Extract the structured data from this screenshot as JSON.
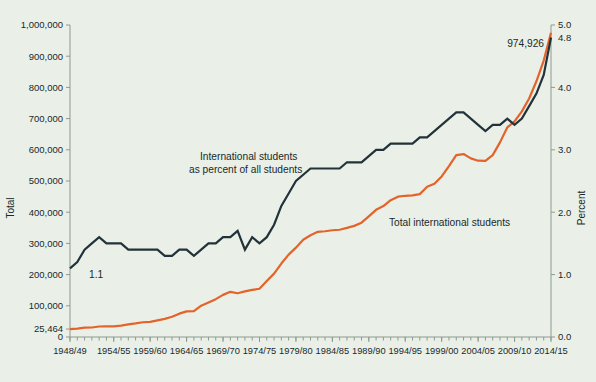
{
  "chart_data": {
    "type": "line",
    "title": "",
    "xlabel": "",
    "ylabel": "Total",
    "y2label": "Percent",
    "grid": false,
    "legend_position": "inline-annotations",
    "x_tick_labels": [
      "1948/49",
      "1954/55",
      "1959/60",
      "1964/65",
      "1969/70",
      "1974/75",
      "1979/80",
      "1984/85",
      "1989/90",
      "1994/95",
      "1999/00",
      "2004/05",
      "2009/10",
      "2014/15"
    ],
    "x_tick_years": [
      1948,
      1954,
      1959,
      1964,
      1969,
      1974,
      1979,
      1984,
      1989,
      1994,
      1999,
      2004,
      2009,
      2014
    ],
    "x_minor_tick_interval_years": 1,
    "xlim": [
      1948,
      2014
    ],
    "ylim": [
      0,
      1000000
    ],
    "y_tick_labels": [
      "0",
      "25,464",
      "100,000",
      "200,000",
      "300,000",
      "400,000",
      "500,000",
      "600,000",
      "700,000",
      "800,000",
      "900,000",
      "1,000,000"
    ],
    "y_tick_values": [
      0,
      25464,
      100000,
      200000,
      300000,
      400000,
      500000,
      600000,
      700000,
      800000,
      900000,
      1000000
    ],
    "y2lim": [
      0,
      5.0
    ],
    "y2_tick_labels": [
      "0.0",
      "1.0",
      "2.0",
      "3.0",
      "4.0",
      "5.0"
    ],
    "y2_tick_values": [
      0.0,
      1.0,
      2.0,
      3.0,
      4.0,
      5.0
    ],
    "series": [
      {
        "name": "Total international students",
        "axis": "left",
        "color": "#e4632a",
        "annotation": "Total international students",
        "start_label": "25,464",
        "end_label": "974,926",
        "x": [
          1948,
          1949,
          1950,
          1951,
          1952,
          1953,
          1954,
          1955,
          1956,
          1957,
          1958,
          1959,
          1960,
          1961,
          1962,
          1963,
          1964,
          1965,
          1966,
          1967,
          1968,
          1969,
          1970,
          1971,
          1972,
          1973,
          1974,
          1975,
          1976,
          1977,
          1978,
          1979,
          1980,
          1981,
          1982,
          1983,
          1984,
          1985,
          1986,
          1987,
          1988,
          1989,
          1990,
          1991,
          1992,
          1993,
          1994,
          1995,
          1996,
          1997,
          1998,
          1999,
          2000,
          2001,
          2002,
          2003,
          2004,
          2005,
          2006,
          2007,
          2008,
          2009,
          2010,
          2011,
          2012,
          2013,
          2014
        ],
        "values": [
          25464,
          26759,
          29813,
          30462,
          33675,
          33833,
          34232,
          36494,
          40666,
          43391,
          47245,
          48486,
          53107,
          58086,
          64705,
          74814,
          82045,
          82709,
          100262,
          110315,
          121362,
          134959,
          144708,
          140126,
          146097,
          151066,
          154580,
          179344,
          203068,
          235509,
          263938,
          286343,
          311882,
          326299,
          336985,
          338894,
          342113,
          343777,
          349609,
          356187,
          366354,
          386851,
          407529,
          419585,
          438618,
          449749,
          452635,
          453787,
          457984,
          481280,
          490933,
          514723,
          547867,
          582996,
          586323,
          572509,
          565039,
          564766,
          582984,
          623805,
          671616,
          690923,
          723277,
          764495,
          819644,
          886052,
          974926
        ]
      },
      {
        "name": "International students as percent of all students",
        "axis": "right",
        "color": "#22323a",
        "annotation": "International students as percent of all students",
        "start_label": "1.1",
        "end_label": "4.8",
        "x": [
          1948,
          1949,
          1950,
          1951,
          1952,
          1953,
          1954,
          1955,
          1956,
          1957,
          1958,
          1959,
          1960,
          1961,
          1962,
          1963,
          1964,
          1965,
          1966,
          1967,
          1968,
          1969,
          1970,
          1971,
          1972,
          1973,
          1974,
          1975,
          1976,
          1977,
          1978,
          1979,
          1980,
          1981,
          1982,
          1983,
          1984,
          1985,
          1986,
          1987,
          1988,
          1989,
          1990,
          1991,
          1992,
          1993,
          1994,
          1995,
          1996,
          1997,
          1998,
          1999,
          2000,
          2001,
          2002,
          2003,
          2004,
          2005,
          2006,
          2007,
          2008,
          2009,
          2010,
          2011,
          2012,
          2013,
          2014
        ],
        "values": [
          1.1,
          1.2,
          1.4,
          1.5,
          1.6,
          1.5,
          1.5,
          1.5,
          1.4,
          1.4,
          1.4,
          1.4,
          1.4,
          1.3,
          1.3,
          1.4,
          1.4,
          1.3,
          1.4,
          1.5,
          1.5,
          1.6,
          1.6,
          1.7,
          1.4,
          1.6,
          1.5,
          1.6,
          1.8,
          2.1,
          2.3,
          2.5,
          2.6,
          2.7,
          2.7,
          2.7,
          2.7,
          2.7,
          2.8,
          2.8,
          2.8,
          2.9,
          3.0,
          3.0,
          3.1,
          3.1,
          3.1,
          3.1,
          3.2,
          3.2,
          3.3,
          3.4,
          3.5,
          3.6,
          3.6,
          3.5,
          3.4,
          3.3,
          3.4,
          3.4,
          3.5,
          3.4,
          3.5,
          3.7,
          3.9,
          4.2,
          4.8
        ]
      }
    ],
    "annotations": [
      {
        "text": "International students as percent of all students",
        "target": "percent-series"
      },
      {
        "text": "Total international students",
        "target": "total-series"
      },
      {
        "text": "1.1",
        "target": "percent-series-start"
      },
      {
        "text": "974,926",
        "target": "total-series-end"
      },
      {
        "text": "25,464",
        "target": "total-series-start"
      },
      {
        "text": "4.8",
        "target": "percent-series-end"
      }
    ],
    "colors": {
      "background": "#eaf0e7",
      "total_series": "#e4632a",
      "percent_series": "#22323a",
      "axis": "#8d9a90",
      "text": "#20282a"
    }
  }
}
